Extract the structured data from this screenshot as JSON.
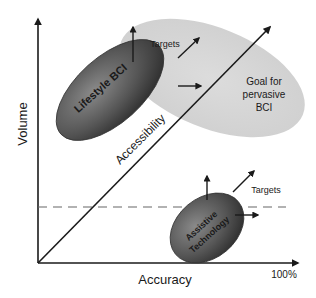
{
  "diagram": {
    "axes": {
      "y_label": "Volume",
      "x_label": "Accuracy",
      "x_max_label": "100%"
    },
    "diagonal_label": "Accessibility",
    "regions": [
      {
        "name": "goal",
        "lines": [
          "Goal for",
          "pervasive",
          "BCI"
        ],
        "color": "#d4d4d4"
      },
      {
        "name": "lifestyle",
        "label": "Lifestyle BCI",
        "color": "#5a5a5a"
      },
      {
        "name": "assistive",
        "lines": [
          "Assistive",
          "Technology"
        ],
        "color": "#5a5a5a"
      }
    ],
    "targets_label_top": "Targets",
    "targets_label_bottom": "Targets"
  }
}
